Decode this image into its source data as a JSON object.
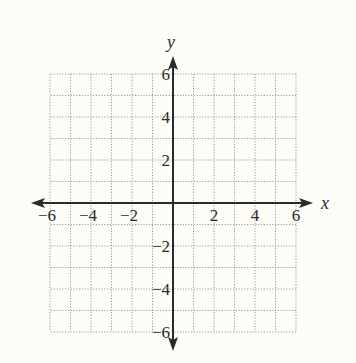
{
  "chart_data": {
    "type": "coordinate-grid",
    "title": "",
    "xlabel": "x",
    "ylabel": "y",
    "xlim": [
      -6,
      6
    ],
    "ylim": [
      -6,
      6
    ],
    "grid": true,
    "grid_step": 1,
    "grid_style": "dotted",
    "x_tick_labels": [
      "−6",
      "−4",
      "−2",
      "2",
      "4",
      "6"
    ],
    "x_tick_values": [
      -6,
      -4,
      -2,
      2,
      4,
      6
    ],
    "y_tick_labels": [
      "6",
      "4",
      "2",
      "−2",
      "−4",
      "−6"
    ],
    "y_tick_values": [
      6,
      4,
      2,
      -2,
      -4,
      -6
    ],
    "series": []
  },
  "colors": {
    "background": "#fdfcf6",
    "axis": "#2a2a2a",
    "grid": "#9a9a9a"
  }
}
